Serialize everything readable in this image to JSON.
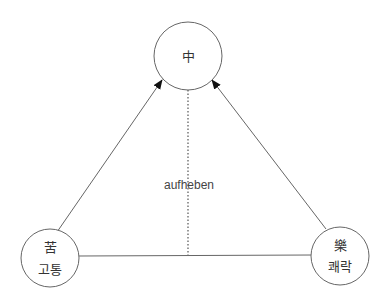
{
  "diagram": {
    "title": "",
    "colors": {
      "stroke": "#666666",
      "dotted": "#555555",
      "text": "#333333",
      "background": "#ffffff"
    },
    "nodes": {
      "top": {
        "id": "zhong",
        "hanja": "中",
        "korean": "",
        "cx": 188,
        "cy": 56,
        "r": 34
      },
      "bottom_left": {
        "id": "go",
        "hanja": "苦",
        "korean": "고통",
        "cx": 50,
        "cy": 258,
        "r": 29
      },
      "bottom_right": {
        "id": "rak",
        "hanja": "樂",
        "korean": "쾌락",
        "cx": 340,
        "cy": 256,
        "r": 29
      }
    },
    "edges": [
      {
        "from": "bottom_left",
        "to": "top",
        "style": "solid",
        "arrow": true
      },
      {
        "from": "bottom_right",
        "to": "top",
        "style": "solid",
        "arrow": true
      },
      {
        "from": "bottom_left",
        "to": "bottom_right",
        "style": "solid",
        "arrow": false
      },
      {
        "from": "top",
        "to": "base_line",
        "style": "dotted",
        "arrow": false
      }
    ],
    "center_label": "aufheben"
  }
}
